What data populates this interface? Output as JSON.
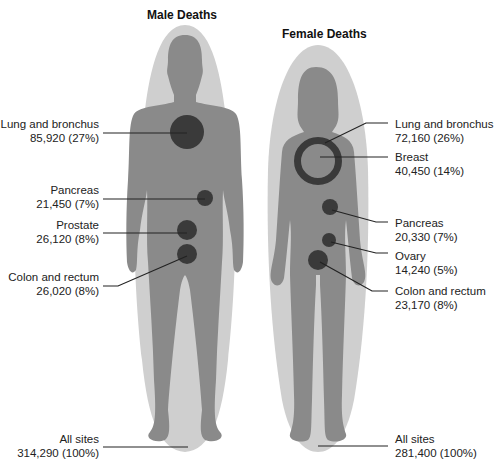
{
  "male": {
    "title": "Male Deaths",
    "sites": [
      {
        "name": "Lung and bronchus",
        "value": "85,920 (27%)"
      },
      {
        "name": "Pancreas",
        "value": "21,450 (7%)"
      },
      {
        "name": "Prostate",
        "value": "26,120 (8%)"
      },
      {
        "name": "Colon and rectum",
        "value": "26,020 (8%)"
      }
    ],
    "all_sites": {
      "name": "All sites",
      "value": "314,290 (100%)"
    }
  },
  "female": {
    "title": "Female Deaths",
    "sites": [
      {
        "name": "Lung and bronchus",
        "value": "72,160 (26%)"
      },
      {
        "name": "Breast",
        "value": "40,450 (14%)"
      },
      {
        "name": "Pancreas",
        "value": "20,330 (7%)"
      },
      {
        "name": "Ovary",
        "value": "14,240 (5%)"
      },
      {
        "name": "Colon and rectum",
        "value": "23,170 (8%)"
      }
    ],
    "all_sites": {
      "name": "All sites",
      "value": "281,400 (100%)"
    }
  },
  "colors": {
    "halo": "#cfcfcf",
    "body": "#8a8a8a",
    "organ": "#3a3a3a",
    "leader": "#222222"
  }
}
